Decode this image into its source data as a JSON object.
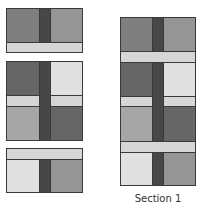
{
  "diagram": {
    "type": "quilt-block-assembly",
    "caption": "Section 1",
    "colors": {
      "medium": "#7f7f7f",
      "medium_light": "#9a9a9a",
      "dark": "#666666",
      "strip": "#474747",
      "light": "#d6d6d6",
      "lightest": "#e0e0e0",
      "outline": "#3a3a3a"
    },
    "left_units": [
      {
        "name": "unit-1",
        "pieces": [
          "medium",
          "strip",
          "medium_light",
          "light-bar-bottom"
        ]
      },
      {
        "name": "unit-2",
        "pieces": [
          "dark",
          "strip",
          "lightest",
          "light-bar-split",
          "medium_light",
          "dark"
        ]
      },
      {
        "name": "unit-3",
        "pieces": [
          "light-bar-top",
          "lightest",
          "strip",
          "medium_light"
        ]
      }
    ],
    "assembled": {
      "name": "section-1",
      "units": 3
    }
  }
}
